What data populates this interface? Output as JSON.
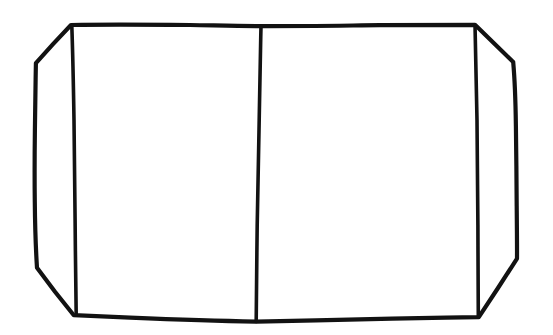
{
  "document": {
    "title": "Hand-drawn chamfered rectangle sketch",
    "medium": "ink line drawing on white paper",
    "background_color": "#ffffff",
    "ink_color": "#121212",
    "canvas": {
      "width": 553,
      "height": 335
    },
    "text_content": "",
    "labels": [],
    "description": "A single hand-drawn closed figure: a wide rectangle whose four corners are cut off by short diagonal chamfers, forming an elongated octagon. Three interior vertical lines divide it: one just inside the left chamfers, one near the horizontal centre, and one just inside the right chamfers."
  },
  "drawing": {
    "stroke_color": "#121212",
    "stroke_width_outline": 4.2,
    "stroke_width_inner": 3.6,
    "shapes": [
      {
        "id": "outer-octagon",
        "name": "outer-octagon-outline",
        "type": "closed-polyline",
        "closed": true,
        "stroke_width": 4.2,
        "points": [
          [
            71,
            25
          ],
          [
            261,
            26
          ],
          [
            475,
            25
          ],
          [
            496,
            45
          ],
          [
            513,
            62
          ],
          [
            516,
            150
          ],
          [
            517,
            259
          ],
          [
            498,
            288
          ],
          [
            479,
            317
          ],
          [
            256,
            322
          ],
          [
            74,
            315
          ],
          [
            55,
            292
          ],
          [
            37,
            268
          ],
          [
            35,
            150
          ],
          [
            36,
            63
          ]
        ]
      },
      {
        "id": "divider-left",
        "name": "left-vertical-divider",
        "type": "polyline",
        "closed": false,
        "stroke_width": 3.6,
        "points": [
          [
            72,
            26
          ],
          [
            74,
            120
          ],
          [
            75,
            220
          ],
          [
            76,
            315
          ]
        ]
      },
      {
        "id": "divider-center",
        "name": "center-vertical-divider",
        "type": "polyline",
        "closed": false,
        "stroke_width": 3.6,
        "points": [
          [
            261,
            27
          ],
          [
            259,
            120
          ],
          [
            257,
            225
          ],
          [
            256,
            321
          ]
        ]
      },
      {
        "id": "divider-right",
        "name": "right-vertical-divider",
        "type": "polyline",
        "closed": false,
        "stroke_width": 3.6,
        "points": [
          [
            475,
            26
          ],
          [
            477,
            120
          ],
          [
            478,
            225
          ],
          [
            478,
            316
          ]
        ]
      }
    ],
    "panels": [
      {
        "id": "panel-far-left",
        "name": "far-left-flap-panel",
        "fill": "#ffffff"
      },
      {
        "id": "panel-left",
        "name": "left-main-panel",
        "fill": "#ffffff"
      },
      {
        "id": "panel-right",
        "name": "right-main-panel",
        "fill": "#ffffff"
      },
      {
        "id": "panel-far-right",
        "name": "far-right-flap-panel",
        "fill": "#ffffff"
      }
    ]
  }
}
